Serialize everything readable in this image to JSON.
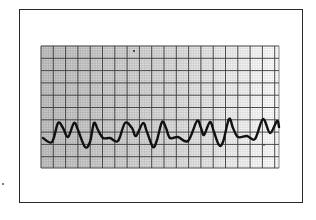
{
  "chart_data": {
    "type": "line",
    "title": "",
    "subtitle": "",
    "xlabel": "",
    "ylabel": "",
    "grid": true,
    "legend": [],
    "grid_layout": {
      "x0": 41,
      "y0": 46,
      "x1": 279,
      "y1": 168,
      "major_cell_px": 12.3,
      "minor_per_major": 5,
      "major_columns": 19,
      "major_rows": 10
    },
    "waveform_points_px": [
      [
        43,
        138
      ],
      [
        52,
        142
      ],
      [
        58,
        123
      ],
      [
        63,
        128
      ],
      [
        68,
        137
      ],
      [
        74,
        123
      ],
      [
        78,
        130
      ],
      [
        85,
        147
      ],
      [
        90,
        142
      ],
      [
        94,
        123
      ],
      [
        98,
        130
      ],
      [
        103,
        138
      ],
      [
        110,
        138
      ],
      [
        118,
        141
      ],
      [
        125,
        123
      ],
      [
        132,
        128
      ],
      [
        136,
        136
      ],
      [
        143,
        123
      ],
      [
        147,
        132
      ],
      [
        153,
        147
      ],
      [
        157,
        140
      ],
      [
        162,
        122
      ],
      [
        166,
        128
      ],
      [
        170,
        138
      ],
      [
        178,
        137
      ],
      [
        188,
        141
      ],
      [
        197,
        121
      ],
      [
        201,
        128
      ],
      [
        204,
        135
      ],
      [
        210,
        122
      ],
      [
        214,
        132
      ],
      [
        219,
        145
      ],
      [
        223,
        142
      ],
      [
        229,
        119
      ],
      [
        233,
        128
      ],
      [
        238,
        137
      ],
      [
        247,
        136
      ],
      [
        255,
        139
      ],
      [
        263,
        119
      ],
      [
        270,
        133
      ],
      [
        277,
        121
      ],
      [
        279,
        127
      ]
    ],
    "complexes": [
      {
        "type": "double-peak",
        "peaks_x": [
          58,
          74
        ],
        "trough_x": 85
      },
      {
        "type": "single-peak",
        "peaks_x": [
          94
        ],
        "trough_x": null
      },
      {
        "type": "double-peak",
        "peaks_x": [
          125,
          143
        ],
        "trough_x": 153
      },
      {
        "type": "single-peak",
        "peaks_x": [
          162
        ],
        "trough_x": null
      },
      {
        "type": "double-peak",
        "peaks_x": [
          197,
          210
        ],
        "trough_x": 219
      },
      {
        "type": "single-peak",
        "peaks_x": [
          229
        ],
        "trough_x": null
      },
      {
        "type": "double-peak",
        "peaks_x": [
          263,
          277
        ],
        "trough_x": null
      }
    ]
  },
  "colors": {
    "frame": "#2a2a2a",
    "major_grid": "#3a3a3a",
    "minor_grid": "#9a9a9a",
    "waveform": "#111111",
    "paper": "#ffffff"
  }
}
